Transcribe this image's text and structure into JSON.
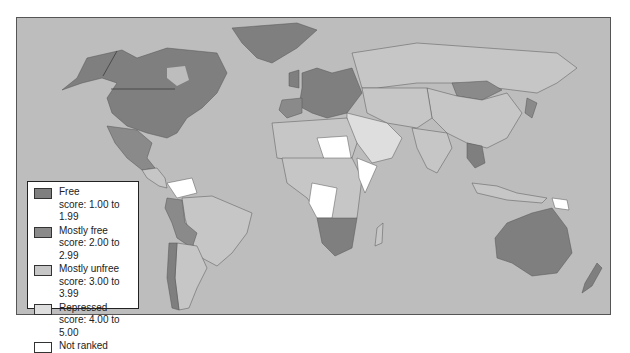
{
  "map": {
    "title": "",
    "colors": {
      "ocean": "#bdbdbd",
      "free": "#7f7f7f",
      "mostly_free": "#8c8c8c",
      "mostly_unfree": "#c8c8c8",
      "repressed": "#e0e0e0",
      "not_ranked": "#ffffff",
      "border": "#555555"
    }
  },
  "legend": {
    "items": [
      {
        "label": "Free",
        "score": "score: 1.00 to 1.99",
        "color": "#7f7f7f"
      },
      {
        "label": "Mostly free",
        "score": "score: 2.00 to 2.99",
        "color": "#8a8a8a"
      },
      {
        "label": "Mostly unfree",
        "score": "score: 3.00 to 3.99",
        "color": "#c6c6c6"
      },
      {
        "label": "Repressed",
        "score": "score: 4.00 to 5.00",
        "color": "#dedede"
      },
      {
        "label": "Not ranked",
        "score": "",
        "color": "#ffffff"
      }
    ]
  }
}
